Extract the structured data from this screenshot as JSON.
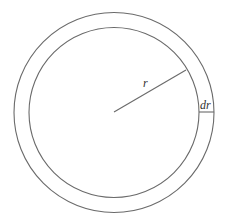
{
  "diagram": {
    "type": "annulus-ring",
    "center": {
      "x": 114,
      "y": 112
    },
    "outer_radius": 100,
    "inner_radius": 85,
    "stroke_color": "#6a6a6a",
    "label_color": "#333333",
    "labels": {
      "radius": "r",
      "thickness": "dr"
    },
    "radius_line": {
      "x1": 114,
      "y1": 112,
      "x2": 186,
      "y2": 70
    },
    "thickness_segment": {
      "x1": 199,
      "y1": 112,
      "x2": 214,
      "y2": 112
    }
  }
}
